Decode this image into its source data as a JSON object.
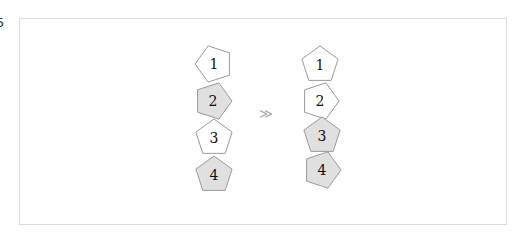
{
  "edge_glyph": "5",
  "diagram": {
    "arrow_symbol": "≫",
    "colors": {
      "white_fill": "#ffffff",
      "gray_fill": "#e0e0e0",
      "stroke": "#9a9a9a"
    },
    "left_stack": [
      {
        "label": "1",
        "fill": "white",
        "orientation": "left"
      },
      {
        "label": "2",
        "fill": "gray",
        "orientation": "right"
      },
      {
        "label": "3",
        "fill": "white",
        "orientation": "up"
      },
      {
        "label": "4",
        "fill": "gray",
        "orientation": "up"
      }
    ],
    "right_stack": [
      {
        "label": "1",
        "fill": "white",
        "orientation": "up"
      },
      {
        "label": "2",
        "fill": "white",
        "orientation": "right"
      },
      {
        "label": "3",
        "fill": "gray",
        "orientation": "up"
      },
      {
        "label": "4",
        "fill": "gray",
        "orientation": "right"
      }
    ]
  }
}
